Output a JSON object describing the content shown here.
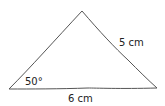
{
  "diagram": {
    "type": "triangle",
    "stroke_color": "#555555",
    "vertices": {
      "apex": [
        82,
        11
      ],
      "left": [
        9,
        89
      ],
      "right": [
        157,
        88
      ]
    },
    "labels": {
      "angle_left": "50°",
      "side_right": "5 cm",
      "side_bottom": "6 cm"
    }
  }
}
